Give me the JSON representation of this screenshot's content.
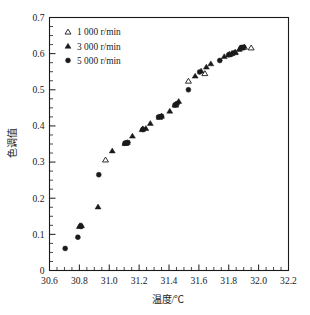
{
  "chart_data": {
    "type": "scatter",
    "title": "",
    "xlabel": "温度/℃",
    "ylabel": "色调值",
    "xlim": [
      30.6,
      32.2
    ],
    "ylim": [
      0,
      0.7
    ],
    "xticks": [
      "30.6",
      "30.8",
      "31.0",
      "31.2",
      "31.4",
      "31.6",
      "31.8",
      "32.0",
      "32.2"
    ],
    "xtick_values": [
      30.6,
      30.8,
      31.0,
      31.2,
      31.4,
      31.6,
      31.8,
      32.0,
      32.2
    ],
    "yticks": [
      "0",
      "0.1",
      "0.2",
      "0.3",
      "0.4",
      "0.5",
      "0.6",
      "0.7"
    ],
    "ytick_values": [
      0,
      0.1,
      0.2,
      0.3,
      0.4,
      0.5,
      0.6,
      0.7
    ],
    "x_minor_per_major": 4,
    "y_minor_per_major": 4,
    "grid": false,
    "legend_position": "upper-left",
    "series": [
      {
        "name": "1 000 r/min",
        "marker": "triangle-open",
        "color": "#1a1a1a",
        "points": [
          [
            30.805,
            0.124
          ],
          [
            30.975,
            0.306
          ],
          [
            31.11,
            0.352
          ],
          [
            31.225,
            0.392
          ],
          [
            31.34,
            0.425
          ],
          [
            31.445,
            0.458
          ],
          [
            31.53,
            0.524
          ],
          [
            31.64,
            0.545
          ],
          [
            31.805,
            0.598
          ],
          [
            31.84,
            0.603
          ],
          [
            31.88,
            0.616
          ],
          [
            31.905,
            0.618
          ],
          [
            31.95,
            0.616
          ]
        ]
      },
      {
        "name": "3 000 r/min",
        "marker": "triangle-filled",
        "color": "#1a1a1a",
        "points": [
          [
            30.8,
            0.122
          ],
          [
            30.815,
            0.124
          ],
          [
            30.925,
            0.176
          ],
          [
            31.02,
            0.331
          ],
          [
            31.105,
            0.352
          ],
          [
            31.12,
            0.354
          ],
          [
            31.155,
            0.372
          ],
          [
            31.22,
            0.39
          ],
          [
            31.245,
            0.393
          ],
          [
            31.275,
            0.407
          ],
          [
            31.335,
            0.424
          ],
          [
            31.35,
            0.427
          ],
          [
            31.405,
            0.441
          ],
          [
            31.44,
            0.458
          ],
          [
            31.465,
            0.468
          ],
          [
            31.575,
            0.538
          ],
          [
            31.615,
            0.552
          ],
          [
            31.65,
            0.563
          ],
          [
            31.68,
            0.572
          ],
          [
            31.77,
            0.592
          ],
          [
            31.8,
            0.597
          ],
          [
            31.82,
            0.6
          ],
          [
            31.845,
            0.604
          ],
          [
            31.87,
            0.612
          ],
          [
            31.89,
            0.616
          ]
        ]
      },
      {
        "name": "5 000 r/min",
        "marker": "circle-filled",
        "color": "#1a1a1a",
        "points": [
          [
            30.705,
            0.061
          ],
          [
            30.79,
            0.092
          ],
          [
            30.81,
            0.122
          ],
          [
            30.93,
            0.265
          ],
          [
            31.105,
            0.352
          ],
          [
            31.125,
            0.354
          ],
          [
            31.225,
            0.39
          ],
          [
            31.33,
            0.425
          ],
          [
            31.35,
            0.427
          ],
          [
            31.44,
            0.458
          ],
          [
            31.455,
            0.462
          ],
          [
            31.53,
            0.5
          ],
          [
            31.605,
            0.549
          ],
          [
            31.74,
            0.581
          ],
          [
            31.8,
            0.597
          ],
          [
            31.83,
            0.602
          ],
          [
            31.885,
            0.617
          ],
          [
            31.9,
            0.618
          ]
        ]
      }
    ]
  },
  "legend": {
    "entries": [
      {
        "label": "1 000 r/min",
        "marker": "triangle-open"
      },
      {
        "label": "3 000 r/min",
        "marker": "triangle-filled"
      },
      {
        "label": "5 000 r/min",
        "marker": "circle-filled"
      }
    ]
  },
  "colors": {
    "foreground": "#1a1a1a",
    "background": "#ffffff"
  }
}
